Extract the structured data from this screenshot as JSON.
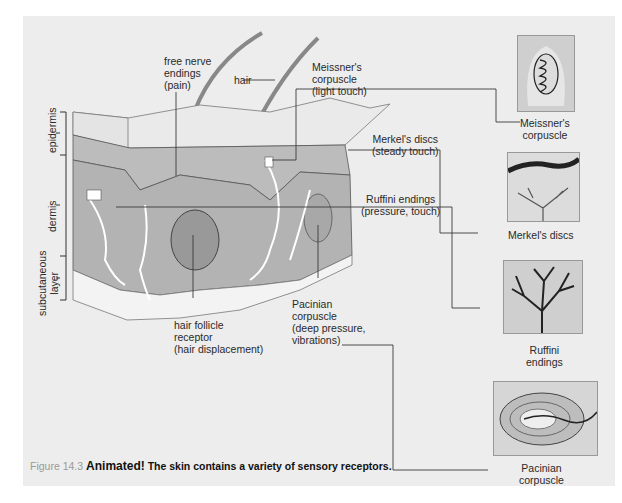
{
  "figure": {
    "number_label": "Figure 14.3",
    "caption_bold_lead": "Animated!",
    "caption_text": " The skin contains a variety of sensory receptors."
  },
  "layers": {
    "epidermis": "epidermis",
    "dermis": "dermis",
    "subcutaneous": "subcutaneous\nlayer"
  },
  "callouts": {
    "free_nerve": "free nerve\nendings\n(pain)",
    "hair": "hair",
    "meissner": "Meissner's\ncorpuscle\n(light touch)",
    "merkel": "Merkel's discs\n(steady touch)",
    "ruffini": "Ruffini endings\n(pressure, touch)",
    "pacinian": "Pacinian\ncorpuscle\n(deep pressure,\nvibrations)",
    "hair_follicle": "hair follicle\nreceptor\n(hair displacement)"
  },
  "insets": {
    "meissner": "Meissner's\ncorpuscle",
    "merkel": "Merkel's discs",
    "ruffini": "Ruffini\nendings",
    "pacinian": "Pacinian\ncorpuscle"
  },
  "colors": {
    "panel": "#ededed",
    "dermis": "#b3b3b3",
    "epidermis": "#e4e4e4",
    "subcutaneous": "#f3f3f3",
    "line": "#3a3a3a"
  }
}
